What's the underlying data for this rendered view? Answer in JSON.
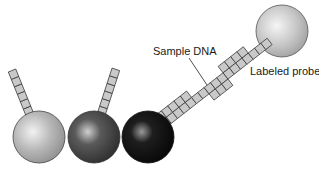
{
  "labels": {
    "sample_dna": "Sample DNA",
    "labeled_probe": "Labeled probe"
  },
  "colors": {
    "sphere_light": "#b5b5b5",
    "sphere_dark": "#4a4a4a",
    "sphere_black": "#151515",
    "sphere_probe": "#c8c8c8",
    "block_fill": "#c9c9c9",
    "block_stroke": "#333333"
  }
}
